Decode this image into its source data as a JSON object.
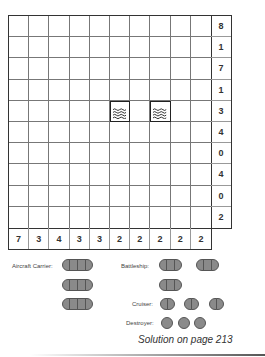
{
  "puzzle": {
    "type": "battleships",
    "grid_size": [
      10,
      10
    ],
    "row_clues": [
      "8",
      "1",
      "7",
      "1",
      "3",
      "4",
      "0",
      "4",
      "0",
      "2"
    ],
    "col_clues": [
      "7",
      "3",
      "4",
      "3",
      "3",
      "2",
      "2",
      "2",
      "2",
      "2"
    ],
    "given_cells": [
      {
        "row": 4,
        "col": 5,
        "type": "water",
        "icon": "water-waves-icon"
      },
      {
        "row": 4,
        "col": 7,
        "type": "water",
        "icon": "water-waves-icon"
      }
    ]
  },
  "legend": {
    "aircraft_carrier": {
      "label": "Aircraft Carrier:",
      "count": 3,
      "length": 4
    },
    "battleship": {
      "label": "Battleship:",
      "count": 3,
      "length": 3
    },
    "cruiser": {
      "label": "Cruiser:",
      "count": 3,
      "length": 2
    },
    "destroyer": {
      "label": "Destroyer:",
      "count": 3,
      "length": 1
    }
  },
  "footer": {
    "text": "Solution on page 213"
  },
  "colors": {
    "ship_fill": "#8a8a8a",
    "ship_border": "#555555",
    "grid_line": "#777777",
    "grid_border": "#333333"
  }
}
